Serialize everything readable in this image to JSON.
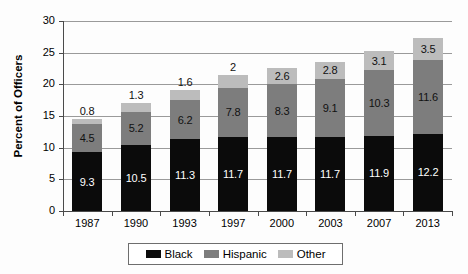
{
  "chart_data": {
    "type": "bar",
    "subtype": "stacked-bar",
    "title": "",
    "xlabel": "",
    "ylabel": "Percent of Officers",
    "ylim": [
      0,
      30
    ],
    "yticks": [
      0,
      5,
      10,
      15,
      20,
      25,
      30
    ],
    "ytick_labels": [
      "0",
      "5",
      "10",
      "15",
      "20",
      "25",
      "30"
    ],
    "grid": true,
    "grid_axis": "y",
    "legend_position": "bottom",
    "categories": [
      "1987",
      "1990",
      "1993",
      "1997",
      "2000",
      "2003",
      "2007",
      "2013"
    ],
    "series": [
      {
        "name": "Black",
        "color": "#0b0b0b",
        "values": [
          9.3,
          10.5,
          11.3,
          11.7,
          11.7,
          11.7,
          11.9,
          12.2
        ],
        "labels": [
          "9.3",
          "10.5",
          "11.3",
          "11.7",
          "11.7",
          "11.7",
          "11.9",
          "12.2"
        ]
      },
      {
        "name": "Hispanic",
        "color": "#7d7d7d",
        "values": [
          4.5,
          5.2,
          6.2,
          7.8,
          8.3,
          9.1,
          10.3,
          11.6
        ],
        "labels": [
          "4.5",
          "5.2",
          "6.2",
          "7.8",
          "8.3",
          "9.1",
          "10.3",
          "11.6"
        ]
      },
      {
        "name": "Other",
        "color": "#bcbcbc",
        "values": [
          0.8,
          1.3,
          1.6,
          2.0,
          2.6,
          2.8,
          3.1,
          3.5
        ],
        "labels": [
          "0.8",
          "1.3",
          "1.6",
          "2",
          "2.6",
          "2.8",
          "3.1",
          "3.5"
        ]
      }
    ],
    "totals": [
      14.6,
      17.0,
      19.1,
      21.5,
      22.6,
      23.6,
      25.3,
      27.3
    ]
  },
  "axis": {
    "y_title": "Percent of Officers"
  },
  "legend": {
    "items": [
      {
        "label": "Black",
        "color": "#0b0b0b"
      },
      {
        "label": "Hispanic",
        "color": "#7d7d7d"
      },
      {
        "label": "Other",
        "color": "#bcbcbc"
      }
    ]
  }
}
